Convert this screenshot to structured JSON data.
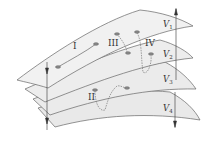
{
  "diagram": {
    "type": "stacked-manifolds",
    "colors": {
      "sheet_fill": "#ececec",
      "sheet_fill_top": "#f2f2f2",
      "outline": "#666666",
      "trajectory": "#777777",
      "arrow": "#333333"
    },
    "sheets": [
      {
        "id": "V1",
        "label": "V",
        "subscript": "1"
      },
      {
        "id": "V2",
        "label": "V",
        "subscript": "2"
      },
      {
        "id": "V3",
        "label": "V",
        "subscript": "3"
      },
      {
        "id": "V4",
        "label": "V",
        "subscript": "4"
      }
    ],
    "trajectories": [
      {
        "id": "I",
        "label": "I"
      },
      {
        "id": "II",
        "label": "II"
      },
      {
        "id": "III",
        "label": "III"
      },
      {
        "id": "IV",
        "label": "IV"
      }
    ]
  }
}
